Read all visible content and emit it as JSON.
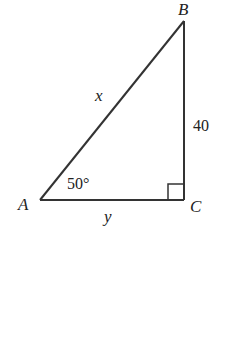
{
  "diagram": {
    "type": "right-triangle",
    "stroke_color": "#333333",
    "vertices": {
      "A": {
        "label": "A",
        "x": 40,
        "y": 200
      },
      "B": {
        "label": "B",
        "x": 184,
        "y": 21
      },
      "C": {
        "label": "C",
        "x": 184,
        "y": 200
      }
    },
    "sides": {
      "hypotenuse_AB": {
        "label": "x"
      },
      "vertical_BC": {
        "label": "40"
      },
      "base_AC": {
        "label": "y"
      }
    },
    "angles": {
      "A": {
        "label": "50°"
      },
      "C": {
        "label": "right-angle-marker"
      }
    }
  }
}
